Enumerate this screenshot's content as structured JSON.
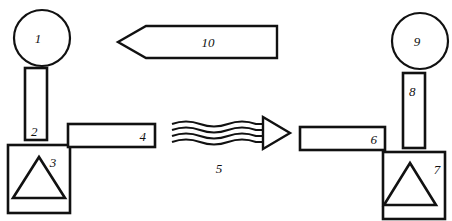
{
  "diagram": {
    "type": "technical-schematic",
    "background_color": "#ffffff",
    "line_color": "#111111",
    "width": 452,
    "height": 221,
    "labels": {
      "item1": "1",
      "item2": "2",
      "item3": "3",
      "item4": "4",
      "item5": "5",
      "item6": "6",
      "item7": "7",
      "item8": "8",
      "item9": "9",
      "item10": "10"
    },
    "components": [
      {
        "ref": "1",
        "shape": "circle",
        "side": "left",
        "description": "circle head at top of left assembly",
        "cx": 42,
        "cy": 38,
        "r": 28
      },
      {
        "ref": "2",
        "shape": "rectangle",
        "side": "left",
        "description": "vertical post below left circle",
        "x": 25,
        "y": 68,
        "w": 22,
        "h": 72
      },
      {
        "ref": "3",
        "shape": "rectangle-with-triangle",
        "side": "left",
        "description": "square base enclosing a triangle",
        "x": 8,
        "y": 145,
        "w": 62,
        "h": 68
      },
      {
        "ref": "4",
        "shape": "rectangle",
        "side": "left",
        "description": "horizontal bar extending right from left base",
        "x": 68,
        "y": 124,
        "w": 87,
        "h": 23
      },
      {
        "ref": "5",
        "shape": "wavy-arrow",
        "side": "center",
        "description": "wavy transmission arrow pointing right",
        "x1": 172,
        "x2": 290,
        "y": 133,
        "wave_count": 4,
        "direction": "right"
      },
      {
        "ref": "6",
        "shape": "rectangle",
        "side": "right",
        "description": "horizontal bar extending left from right base",
        "x": 300,
        "y": 127,
        "w": 85,
        "h": 23
      },
      {
        "ref": "7",
        "shape": "rectangle-with-triangle",
        "side": "right",
        "description": "square base enclosing a triangle",
        "x": 383,
        "y": 152,
        "w": 62,
        "h": 67
      },
      {
        "ref": "8",
        "shape": "rectangle",
        "side": "right",
        "description": "vertical post below right circle",
        "x": 403,
        "y": 73,
        "w": 22,
        "h": 75
      },
      {
        "ref": "9",
        "shape": "circle",
        "side": "right",
        "description": "circle head at top of right assembly",
        "cx": 420,
        "cy": 41,
        "r": 28
      },
      {
        "ref": "10",
        "shape": "block-arrow",
        "side": "top-center",
        "description": "hollow block arrow pointing left",
        "tip_x": 118,
        "tail_x": 277,
        "y_top": 25,
        "y_bottom": 59,
        "direction": "left"
      }
    ]
  }
}
